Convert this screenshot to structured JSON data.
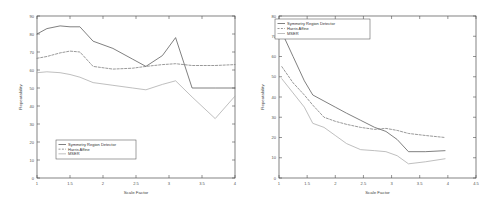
{
  "figure": {
    "background": "#ffffff",
    "panel_count": 2
  },
  "colors": {
    "series_symmetry": "#555555",
    "series_harris": "#777777",
    "series_mser": "#aaaaaa",
    "axis": "#4d4d4d",
    "text": "#444444"
  },
  "chart_data": [
    {
      "id": "left-chart",
      "type": "line",
      "title": "",
      "xlabel": "Scale Factor",
      "ylabel": "Repeatability",
      "xlim": [
        1,
        4
      ],
      "ylim": [
        0,
        90
      ],
      "xticks": [
        1,
        1.5,
        2,
        2.5,
        3,
        3.5,
        4
      ],
      "xticklabels": [
        "1",
        "1.5",
        "2",
        "2.5",
        "3",
        "3.5",
        "4"
      ],
      "yticks": [
        0,
        10,
        20,
        30,
        40,
        50,
        60,
        70,
        80,
        90
      ],
      "yticklabels": [
        "0",
        "10",
        "20",
        "30",
        "40",
        "50",
        "60",
        "70",
        "80",
        "90"
      ],
      "grid": false,
      "legend_position": "lower-left",
      "x": [
        1.0,
        1.15,
        1.35,
        1.5,
        1.65,
        1.85,
        2.15,
        2.45,
        2.65,
        2.9,
        3.1,
        3.35,
        3.7,
        4.0
      ],
      "series": [
        {
          "name": "Symmetry Region Detector",
          "linestyle": "solid",
          "color": "#555555",
          "values": [
            80.0,
            83.0,
            84.5,
            84.0,
            84.0,
            76.0,
            72.0,
            66.0,
            62.0,
            68.0,
            78.0,
            50.0,
            50.0,
            50.0
          ]
        },
        {
          "name": "Harris Affine",
          "linestyle": "dashed",
          "color": "#777777",
          "values": [
            66.5,
            67.5,
            69.5,
            70.5,
            70.0,
            62.0,
            60.5,
            61.0,
            62.0,
            63.0,
            63.5,
            62.5,
            62.5,
            63.0
          ]
        },
        {
          "name": "MSER",
          "linestyle": "solid",
          "color": "#aaaaaa",
          "values": [
            58.5,
            59.0,
            58.5,
            57.5,
            56.0,
            53.0,
            51.5,
            50.0,
            49.0,
            52.0,
            54.0,
            45.0,
            33.0,
            45.5
          ]
        }
      ]
    },
    {
      "id": "right-chart",
      "type": "line",
      "title": "",
      "xlabel": "Scale Factor",
      "ylabel": "Repeatability",
      "xlim": [
        1,
        4.5
      ],
      "ylim": [
        0,
        80
      ],
      "xticks": [
        1,
        1.5,
        2,
        2.5,
        3,
        3.5,
        4,
        4.5
      ],
      "xticklabels": [
        "1",
        "1.5",
        "2",
        "2.5",
        "3",
        "3.5",
        "4",
        "4.5"
      ],
      "yticks": [
        0,
        10,
        20,
        30,
        40,
        50,
        60,
        70,
        80
      ],
      "yticklabels": [
        "0",
        "10",
        "20",
        "30",
        "40",
        "50",
        "60",
        "70",
        "80"
      ],
      "grid": false,
      "legend_position": "upper-left",
      "x": [
        1.05,
        1.25,
        1.45,
        1.6,
        1.8,
        2.0,
        2.2,
        2.45,
        2.7,
        2.9,
        3.1,
        3.3,
        3.6,
        3.95
      ],
      "series": [
        {
          "name": "Symmetry Region Detector",
          "linestyle": "solid",
          "color": "#555555",
          "values": [
            72.0,
            60.0,
            48.0,
            41.0,
            38.0,
            35.0,
            32.0,
            28.5,
            25.0,
            23.0,
            19.0,
            13.0,
            13.0,
            13.5
          ]
        },
        {
          "name": "Harris Affine",
          "linestyle": "dashed",
          "color": "#777777",
          "values": [
            55.0,
            47.0,
            41.0,
            36.0,
            30.0,
            28.0,
            26.5,
            25.0,
            24.0,
            24.5,
            23.5,
            22.0,
            21.0,
            20.0
          ]
        },
        {
          "name": "MSER",
          "linestyle": "solid",
          "color": "#aaaaaa",
          "values": [
            49.0,
            42.0,
            35.0,
            27.0,
            25.0,
            21.0,
            17.0,
            14.0,
            13.5,
            13.0,
            11.0,
            7.0,
            8.0,
            9.5
          ]
        }
      ]
    }
  ]
}
